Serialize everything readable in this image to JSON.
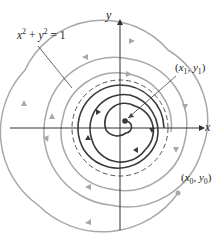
{
  "figure": {
    "type": "phase-portrait",
    "axes": {
      "x_label": "x",
      "y_label": "y",
      "origin_px": [
        120,
        128
      ]
    },
    "limit_cycle": {
      "equation_text": "x² + y² = 1",
      "equation_parts": {
        "x": "x",
        "x_exp": "2",
        "plus": "+",
        "y": "y",
        "y_exp": "2",
        "eq": "= 1"
      },
      "style": "dashed",
      "radius_px": 48
    },
    "inner_point": {
      "label": "(x₁, y₁)",
      "parts": {
        "open": "(",
        "x": "x",
        "x_sub": "1",
        "comma": ", ",
        "y": "y",
        "y_sub": "1",
        "close": ")"
      },
      "trajectory": "spirals outward toward the limit cycle",
      "color": "#3a3a3a"
    },
    "outer_point": {
      "label": "(x₀, y₀)",
      "parts": {
        "open": "(",
        "x": "x",
        "x_sub": "0",
        "comma": ", ",
        "y": "y",
        "y_sub": "0",
        "close": ")"
      },
      "trajectory": "spirals inward toward the limit cycle",
      "color": "#a8a8a8"
    },
    "colors": {
      "axes": "#333333",
      "inner_spiral": "#3a3a3a",
      "outer_spiral": "#a8a8a8",
      "limit_cycle": "#555555",
      "leader_lines": "#444444",
      "background": "#ffffff"
    }
  }
}
